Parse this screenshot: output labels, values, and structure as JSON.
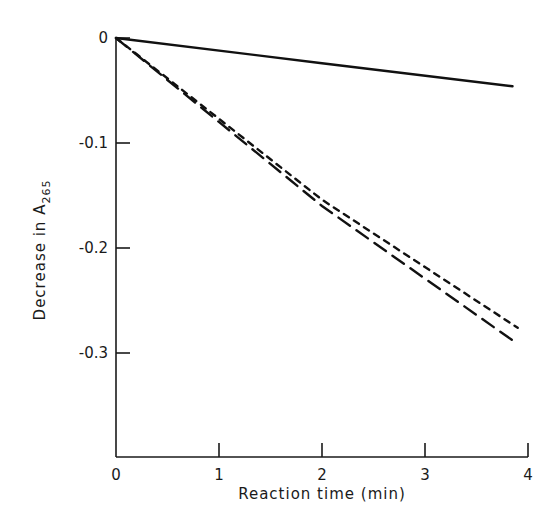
{
  "chart_data": {
    "type": "line",
    "title": "",
    "xlabel": "Reaction time (min)",
    "ylabel": "Decrease in A265",
    "ylabel_parts": {
      "main": "Decrease in A",
      "subscript": "265"
    },
    "xlim": [
      0,
      4
    ],
    "ylim": [
      -0.4,
      0
    ],
    "grid": false,
    "legend": null,
    "x_ticks": [
      0,
      1,
      2,
      3,
      4
    ],
    "x_tick_labels": [
      "0",
      "1",
      "2",
      "3",
      "4"
    ],
    "y_ticks": [
      0,
      -0.1,
      -0.2,
      -0.3
    ],
    "y_tick_labels": [
      "0",
      "-0.1",
      "-0.2",
      "-0.3"
    ],
    "series": [
      {
        "name": "solid",
        "style": "solid",
        "x": [
          0,
          2,
          3.85
        ],
        "y": [
          0,
          -0.024,
          -0.046
        ]
      },
      {
        "name": "short-dashed",
        "style": "short-dash",
        "x": [
          0,
          2,
          3.9
        ],
        "y": [
          0,
          -0.154,
          -0.276
        ]
      },
      {
        "name": "long-dashed",
        "style": "long-dash",
        "x": [
          0,
          2,
          3.88
        ],
        "y": [
          0,
          -0.16,
          -0.29
        ]
      }
    ]
  }
}
